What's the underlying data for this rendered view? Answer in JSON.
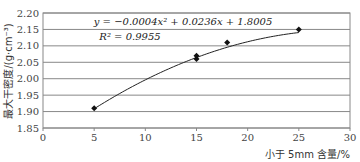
{
  "chart_data": {
    "type": "scatter",
    "title": "",
    "xlabel": "小于 5mm 含量/%",
    "ylabel": "最大干密度/(g·cm⁻³)",
    "xlim": [
      0,
      30
    ],
    "ylim": [
      1.85,
      2.2
    ],
    "xticks": [
      0,
      5,
      10,
      15,
      20,
      25,
      30
    ],
    "xtick_labels": [
      "0",
      "5",
      "10",
      "15",
      "20",
      "25",
      "30"
    ],
    "yticks": [
      1.85,
      1.9,
      1.95,
      2.0,
      2.05,
      2.1,
      2.15,
      2.2
    ],
    "ytick_labels": [
      "1.85",
      "1.90",
      "1.95",
      "2.00",
      "2.05",
      "2.10",
      "2.15",
      "2.20"
    ],
    "grid": "horizontal",
    "legend": "none",
    "series": [
      {
        "name": "实测值",
        "marker": "diamond",
        "x": [
          5,
          15,
          15,
          18,
          25
        ],
        "y": [
          1.91,
          2.06,
          2.07,
          2.11,
          2.15
        ]
      },
      {
        "name": "二次多项式拟合",
        "type": "line",
        "equation": "y = -0.0004x^2 + 0.0236x + 1.8005",
        "coefficients": {
          "a": -0.0004,
          "b": 0.0236,
          "c": 1.8005
        },
        "x_range": [
          5,
          25
        ]
      }
    ],
    "annotations": [
      "y = −0.0004x² + 0.0236x + 1.8005",
      "R² = 0.9955"
    ]
  },
  "text": {
    "equation": "y = −0.0004x² + 0.0236x + 1.8005",
    "r2": "R² = 0.9955",
    "xlabel": "小于 5mm 含量/%",
    "ylabel": "最大干密度/(g·cm⁻³)"
  }
}
